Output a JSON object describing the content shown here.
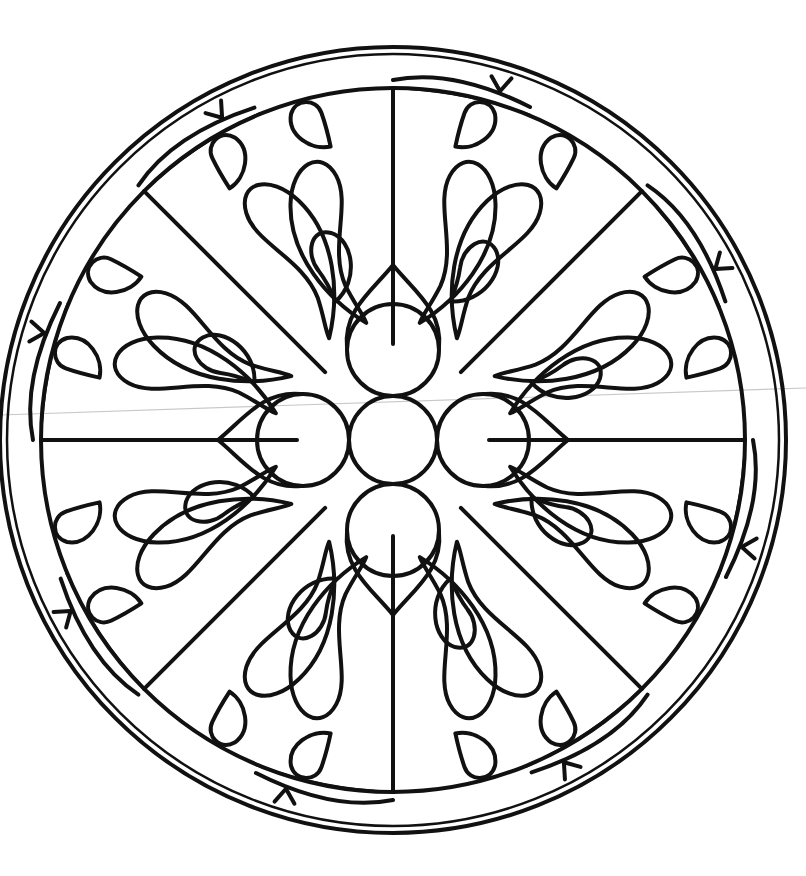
{
  "artwork": {
    "subject": "rose-window-mandala",
    "style": "black line art coloring page",
    "canvas": {
      "width": 806,
      "height": 876,
      "background": "#ffffff"
    },
    "line_color": "#111111",
    "center": {
      "x": 393,
      "y": 440
    },
    "outer_ring": {
      "r_outer": 393,
      "r_inner": 386
    },
    "arch_ring": {
      "r": 352,
      "count": 8
    },
    "spokes": {
      "count": 8,
      "inner_r": 96,
      "outer_r": 352
    },
    "center_circle": {
      "r": 44
    },
    "satellite_circles": {
      "count": 4,
      "offset": 90,
      "r": 46,
      "angles_deg": [
        0,
        90,
        180,
        270
      ]
    },
    "petal_pairs_per_sector": 1,
    "scan_line": {
      "x1": 0,
      "y1": 415,
      "x2": 806,
      "y2": 388,
      "color": "#c8c8c8"
    }
  }
}
